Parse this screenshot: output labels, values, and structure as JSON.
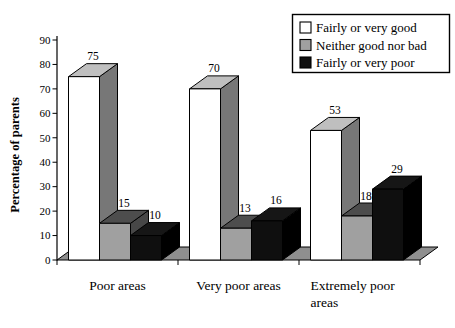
{
  "figure": {
    "background": "#ffffff"
  },
  "chart_data": {
    "type": "bar",
    "projection": "3d",
    "title": "",
    "xlabel": "",
    "ylabel": "Percentage of parents",
    "ylim": [
      0,
      90
    ],
    "ytick_step": 10,
    "grid": false,
    "legend_position": "top-right",
    "value_labels": true,
    "categories": [
      "Poor areas",
      "Very poor areas",
      "Extremely poor\nareas"
    ],
    "series": [
      {
        "name": "Fairly or very good",
        "values": [
          75,
          70,
          53
        ],
        "color_front": "#ffffff",
        "color_top": "#bfbfbf",
        "color_side": "#777777"
      },
      {
        "name": "Neither good nor bad",
        "values": [
          15,
          13,
          18
        ],
        "color_front": "#a0a0a0",
        "color_top": "#4d4d4d",
        "color_side": "#474747"
      },
      {
        "name": "Fairly or very poor",
        "values": [
          10,
          16,
          29
        ],
        "color_front": "#0f0f0f",
        "color_top": "#161616",
        "color_side": "#000000"
      }
    ],
    "floor_color": "#8f8f8f",
    "axis_color": "#000000",
    "outline_color": "#000000"
  }
}
